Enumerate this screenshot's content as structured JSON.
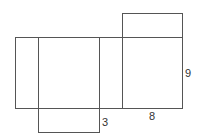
{
  "diagram": {
    "type": "rectangular-prism-net",
    "stroke_color": "#555555",
    "background": "#ffffff",
    "labels": {
      "height": "9",
      "width": "8",
      "depth": "3"
    },
    "faces": [
      {
        "name": "left-side-face",
        "x": 15,
        "y": 37,
        "w": 23,
        "h": 71
      },
      {
        "name": "front-face",
        "x": 38,
        "y": 37,
        "w": 61,
        "h": 71
      },
      {
        "name": "right-side-face",
        "x": 99,
        "y": 37,
        "w": 23,
        "h": 71
      },
      {
        "name": "back-face",
        "x": 122,
        "y": 37,
        "w": 60,
        "h": 71
      },
      {
        "name": "top-face",
        "x": 122,
        "y": 13,
        "w": 60,
        "h": 24
      },
      {
        "name": "bottom-face",
        "x": 38,
        "y": 108,
        "w": 61,
        "h": 24
      }
    ]
  }
}
